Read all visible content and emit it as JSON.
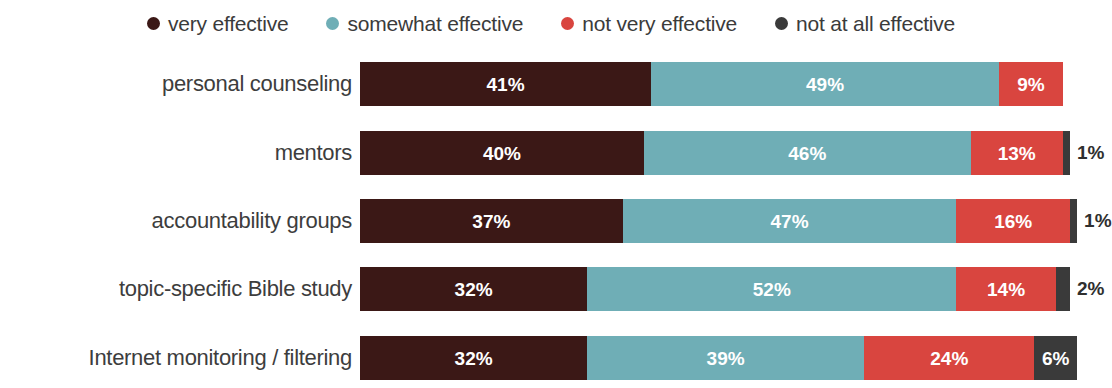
{
  "colors": {
    "very_effective": "#3B1816",
    "somewhat_effective": "#6FAEB6",
    "not_very_effective": "#D9453F",
    "not_at_all_effective": "#3A3A3A",
    "label_text": "#3d3d3d",
    "inside_value_text": "#ffffff",
    "outside_value_text": "#2f2f2f",
    "background": "#ffffff"
  },
  "legend": {
    "items": [
      {
        "label": "very effective",
        "color_key": "very_effective"
      },
      {
        "label": "somewhat effective",
        "color_key": "somewhat_effective"
      },
      {
        "label": "not very effective",
        "color_key": "not_very_effective"
      },
      {
        "label": "not at all effective",
        "color_key": "not_at_all_effective"
      }
    ]
  },
  "chart_data": {
    "type": "bar",
    "subtype": "horizontal-stacked-100",
    "title": "",
    "subtitle": "",
    "xlabel": "",
    "ylabel": "",
    "xlim": [
      0,
      100
    ],
    "grid": false,
    "legend_position": "top",
    "value_suffix": "%",
    "categories": [
      "personal counseling",
      "mentors",
      "accountability groups",
      "topic-specific Bible study",
      "Internet monitoring / filtering"
    ],
    "series": [
      {
        "name": "very effective",
        "values": [
          41,
          40,
          37,
          32,
          32
        ]
      },
      {
        "name": "somewhat effective",
        "values": [
          49,
          46,
          47,
          52,
          39
        ]
      },
      {
        "name": "not very effective",
        "values": [
          9,
          13,
          16,
          14,
          24
        ]
      },
      {
        "name": "not at all effective",
        "values": [
          0,
          1,
          1,
          2,
          6
        ]
      }
    ],
    "rows": [
      {
        "label": "personal counseling",
        "segments": [
          {
            "series": "very effective",
            "value": 41,
            "text": "41%",
            "label_inside": true
          },
          {
            "series": "somewhat effective",
            "value": 49,
            "text": "49%",
            "label_inside": true
          },
          {
            "series": "not very effective",
            "value": 9,
            "text": "9%",
            "label_inside": true
          },
          {
            "series": "not at all effective",
            "value": 0,
            "text": "",
            "label_inside": true
          }
        ]
      },
      {
        "label": "mentors",
        "segments": [
          {
            "series": "very effective",
            "value": 40,
            "text": "40%",
            "label_inside": true
          },
          {
            "series": "somewhat effective",
            "value": 46,
            "text": "46%",
            "label_inside": true
          },
          {
            "series": "not very effective",
            "value": 13,
            "text": "13%",
            "label_inside": true
          },
          {
            "series": "not at all effective",
            "value": 1,
            "text": "1%",
            "label_inside": false
          }
        ]
      },
      {
        "label": "accountability groups",
        "segments": [
          {
            "series": "very effective",
            "value": 37,
            "text": "37%",
            "label_inside": true
          },
          {
            "series": "somewhat effective",
            "value": 47,
            "text": "47%",
            "label_inside": true
          },
          {
            "series": "not very effective",
            "value": 16,
            "text": "16%",
            "label_inside": true
          },
          {
            "series": "not at all effective",
            "value": 1,
            "text": "1%",
            "label_inside": false
          }
        ]
      },
      {
        "label": "topic-specific Bible study",
        "segments": [
          {
            "series": "very effective",
            "value": 32,
            "text": "32%",
            "label_inside": true
          },
          {
            "series": "somewhat effective",
            "value": 52,
            "text": "52%",
            "label_inside": true
          },
          {
            "series": "not very effective",
            "value": 14,
            "text": "14%",
            "label_inside": true
          },
          {
            "series": "not at all effective",
            "value": 2,
            "text": "2%",
            "label_inside": false
          }
        ]
      },
      {
        "label": "Internet monitoring / filtering",
        "segments": [
          {
            "series": "very effective",
            "value": 32,
            "text": "32%",
            "label_inside": true
          },
          {
            "series": "somewhat effective",
            "value": 39,
            "text": "39%",
            "label_inside": true
          },
          {
            "series": "not very effective",
            "value": 24,
            "text": "24%",
            "label_inside": true
          },
          {
            "series": "not at all effective",
            "value": 6,
            "text": "6%",
            "label_inside": true
          }
        ]
      }
    ]
  }
}
